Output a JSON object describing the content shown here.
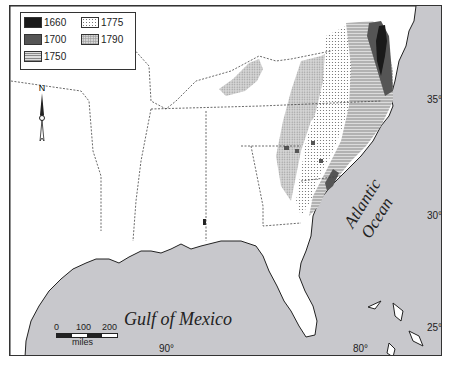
{
  "legend": {
    "items": [
      {
        "year": "1660",
        "pattern": "solid-black",
        "color": "#1a1a1a"
      },
      {
        "year": "1700",
        "pattern": "solid-dark-gray",
        "color": "#555555"
      },
      {
        "year": "1750",
        "pattern": "horizontal-lines"
      },
      {
        "year": "1775",
        "pattern": "light-dots"
      },
      {
        "year": "1790",
        "pattern": "gray-dots"
      }
    ]
  },
  "north_arrow": {
    "label": "N"
  },
  "water_labels": {
    "gulf": "Gulf of Mexico",
    "atlantic": "Atlantic Ocean"
  },
  "latitude_ticks": [
    "35°",
    "30°",
    "25°"
  ],
  "longitude_ticks": [
    "90°",
    "80°"
  ],
  "scale_bar": {
    "ticks": [
      "0",
      "100",
      "200"
    ],
    "unit": "miles"
  },
  "colors": {
    "ocean": "#c8c8cc",
    "land": "#ffffff",
    "border": "#333333"
  }
}
